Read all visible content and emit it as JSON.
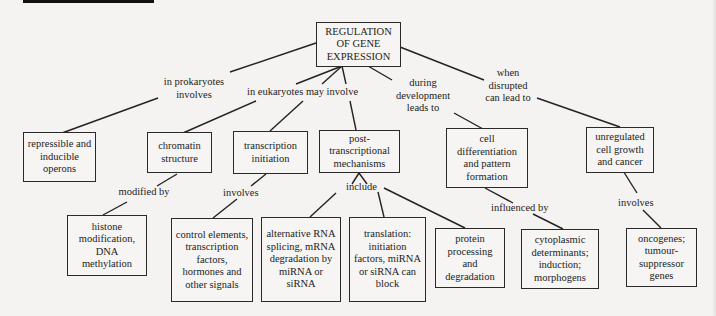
{
  "diagram": {
    "title": "REGULATION OF GENE EXPRESSION",
    "nodes": {
      "root": "REGULATION OF GENE EXPRESSION",
      "operons": "repressible and inducible operons",
      "chromatin": "chromatin structure",
      "transcription": "transcription initiation",
      "posttranscriptional": "post-transcriptional mechanisms",
      "differentiation": "cell differentiation and pattern formation",
      "cancer": "unregulated cell growth and cancer",
      "histone": "histone modification, DNA methylation",
      "control": "control elements, transcription factors, hormones and other signals",
      "splicing": "alternative RNA splicing, mRNA degradation by miRNA or siRNA",
      "translation": "translation: initiation factors, miRNA or siRNA can block",
      "protein": "protein processing and degradation",
      "cytoplasmic": "cytoplasmic determinants; induction; morphogens",
      "oncogenes": "oncogenes; tumour-suppressor genes"
    },
    "links": {
      "prokaryotes": "in prokaryotes involves",
      "eukaryotes": "in eukaryotes may involve",
      "development": "during development leads to",
      "disrupted": "when disrupted can lead to",
      "modified": "modified by",
      "involves_transcription": "involves",
      "include": "include",
      "influenced": "influenced by",
      "involves_cancer": "involves"
    }
  }
}
